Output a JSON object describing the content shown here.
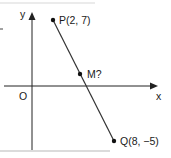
{
  "diagram": {
    "type": "coordinate-geometry",
    "axes": {
      "x_label": "x",
      "y_label": "y",
      "origin_label": "O"
    },
    "points": [
      {
        "name": "P",
        "label": "P(2, 7)",
        "x": 2,
        "y": 7
      },
      {
        "name": "M",
        "label": "M?"
      },
      {
        "name": "Q",
        "label": "Q(8, −5)",
        "x": 8,
        "y": -5
      }
    ],
    "segment": {
      "from": "P",
      "to": "Q"
    },
    "colors": {
      "ink": "#1a1a1a",
      "frame": "#cfcfcf",
      "background": "#ffffff"
    }
  }
}
